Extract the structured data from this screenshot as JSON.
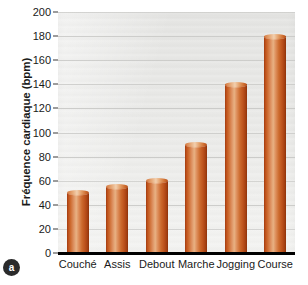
{
  "panel": {
    "badge_label": "a"
  },
  "chart_data": {
    "type": "bar",
    "title": "",
    "xlabel": "",
    "ylabel": "Fréquence cardiaque (bpm)",
    "categories": [
      "Couché",
      "Assis",
      "Debout",
      "Marche",
      "Jogging",
      "Course"
    ],
    "values": [
      50,
      55,
      60,
      90,
      140,
      180
    ],
    "ylim": [
      0,
      200
    ],
    "ytick_values": [
      0,
      20,
      40,
      60,
      80,
      100,
      120,
      140,
      160,
      180,
      200
    ],
    "ytick_labels": [
      "0",
      "20",
      "40",
      "60",
      "80",
      "100",
      "120",
      "140",
      "160",
      "180",
      "200"
    ],
    "grid": true,
    "legend": false,
    "legend_position": "none",
    "bar_style": "cylinder-3d",
    "colors": {
      "bar_light": "#e8b183",
      "bar_mid": "#cc6a2d",
      "bar_dark": "#8d3209",
      "plot_background": "#e9e9e7",
      "gridline": "#c8c8c6",
      "axis": "#000000",
      "text": "#1a1a1a",
      "badge_background": "#2b2b2b"
    }
  }
}
